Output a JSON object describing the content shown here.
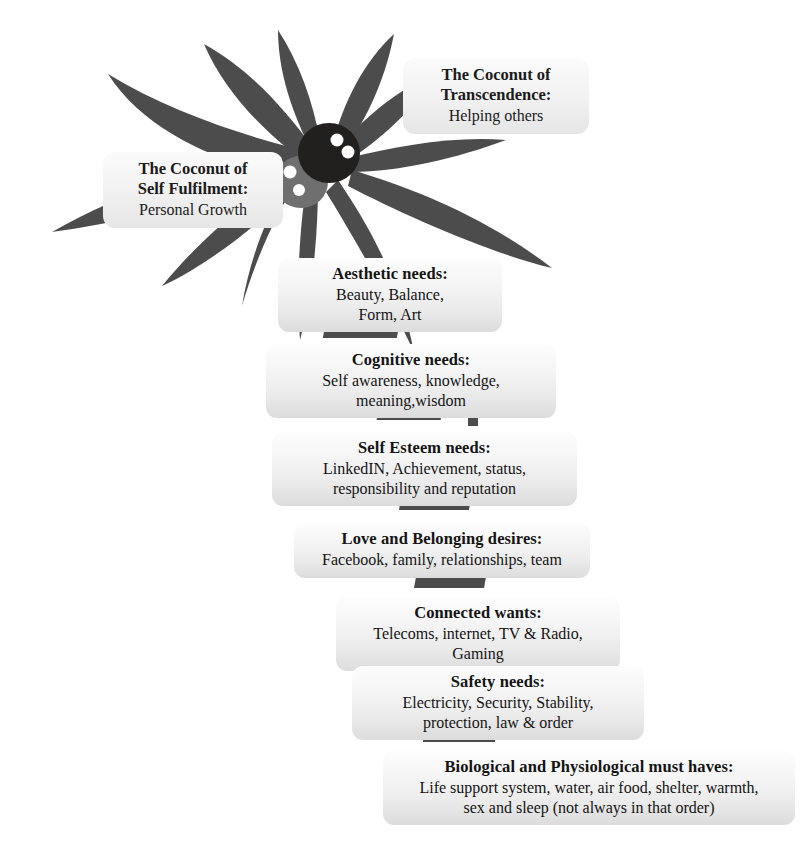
{
  "figure": {
    "palette": {
      "frond": "#4c4c4c",
      "coconut_dark": "#221f1f",
      "coconut_mid": "#6f6f6f",
      "coconut_eye": "#ffffff",
      "box_fill_top": "#fdfdfd",
      "box_fill_bottom": "#dcdcdc",
      "text": "#141414",
      "background": "#ffffff"
    }
  },
  "coconuts": [
    {
      "id": "transcendence",
      "title": "The Coconut of\nTranscendence:",
      "body": "Helping others"
    },
    {
      "id": "self-fulfilment",
      "title": "The Coconut of\nSelf Fulfilment:",
      "body": "Personal Growth"
    }
  ],
  "levels": [
    {
      "id": "aesthetic",
      "title": "Aesthetic needs:",
      "body": "Beauty, Balance,\nForm, Art"
    },
    {
      "id": "cognitive",
      "title": "Cognitive needs:",
      "body": "Self  awareness, knowledge,\nmeaning,wisdom"
    },
    {
      "id": "self-esteem",
      "title": "Self Esteem needs:",
      "body": "LinkedIN, Achievement, status,\nresponsibility and reputation"
    },
    {
      "id": "love-belonging",
      "title": "Love and Belonging desires:",
      "body": "Facebook, family, relationships, team"
    },
    {
      "id": "connected",
      "title": "Connected wants:",
      "body": "Telecoms, internet, TV & Radio,\nGaming"
    },
    {
      "id": "safety",
      "title": "Safety needs:",
      "body": "Electricity, Security, Stability,\nprotection, law & order"
    },
    {
      "id": "biological",
      "title": "Biological and Physiological must haves:",
      "body": "Life support system, water, air food, shelter, warmth,\nsex  and sleep (not always in that order)"
    }
  ]
}
